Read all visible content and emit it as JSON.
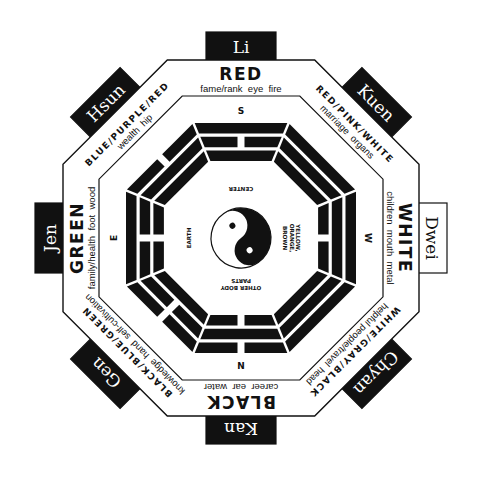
{
  "diagram": {
    "type": "bagua",
    "colors": {
      "ink": "#111111",
      "paper": "#ffffff"
    },
    "sectors": [
      {
        "key": "s",
        "name": "Li",
        "color_label": "RED",
        "associations": "fame/rank  eye  fire",
        "direction": "S",
        "name_box_style": "dark",
        "trigram": [
          1,
          0,
          1
        ]
      },
      {
        "key": "sw",
        "name": "Kuen",
        "color_label": "RED/PINK/WHITE",
        "associations": "marriage  organs",
        "direction": "",
        "name_box_style": "dark",
        "trigram": [
          1,
          1,
          1
        ]
      },
      {
        "key": "w",
        "name": "Dwei",
        "color_label": "WHITE",
        "associations": "children  mouth  metal",
        "direction": "W",
        "name_box_style": "light",
        "trigram": [
          1,
          1,
          0
        ]
      },
      {
        "key": "nw",
        "name": "Chyan",
        "color_label": "WHITE/GRAY/BLACK",
        "associations": "helpful people/travel  head",
        "direction": "",
        "name_box_style": "dark",
        "trigram": [
          1,
          1,
          1
        ]
      },
      {
        "key": "n",
        "name": "Kan",
        "color_label": "BLACK",
        "associations": "career  ear  water",
        "direction": "N",
        "name_box_style": "dark",
        "trigram": [
          0,
          1,
          0
        ]
      },
      {
        "key": "ne",
        "name": "Gen",
        "color_label": "BLACK/BLUE/GREEN",
        "associations": "knowledge  hand  self-cultivation",
        "direction": "",
        "name_box_style": "dark",
        "trigram": [
          0,
          0,
          1
        ]
      },
      {
        "key": "e",
        "name": "Jen",
        "color_label": "GREEN",
        "associations": "family/health  foot  wood",
        "direction": "E",
        "name_box_style": "dark",
        "trigram": [
          1,
          0,
          0
        ]
      },
      {
        "key": "se",
        "name": "Hsun",
        "color_label": "BLUE/PURPLE/RED",
        "associations": "wealth  hip",
        "direction": "",
        "name_box_style": "dark",
        "trigram": [
          0,
          1,
          1
        ]
      }
    ],
    "center": {
      "top_label": "CENTER",
      "right_label_lines": [
        "YELLOW,",
        "ORANGE,",
        "BROWN"
      ],
      "left_label": "EARTH",
      "bottom_label_lines": [
        "OTHER BODY",
        "PARTS"
      ],
      "symbol": "yin-yang"
    }
  }
}
